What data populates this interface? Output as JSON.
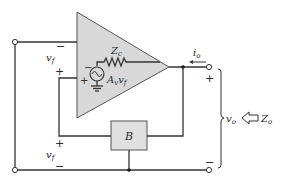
{
  "diagram": {
    "type": "feedback-amplifier-circuit",
    "amplifier": {
      "impedance_label": "Z",
      "impedance_sub": "c",
      "gain_label": "A",
      "gain_sub": "v",
      "gain_var": "v",
      "gain_var_sub": "f",
      "source_minus": "−",
      "source_plus": "+"
    },
    "feedback_block": {
      "label": "B"
    },
    "input_top": {
      "var": "v",
      "sub": "f",
      "top_sign": "−",
      "bottom_sign": "+"
    },
    "input_bottom": {
      "var": "v",
      "sub": "f",
      "top_sign": "+",
      "bottom_sign": "−"
    },
    "output_current": {
      "var": "i",
      "sub": "o"
    },
    "output_voltage": {
      "var": "v",
      "sub": "o",
      "plus": "+",
      "minus": "−"
    },
    "output_impedance": {
      "var": "Z",
      "sub": "o"
    },
    "colors": {
      "amplifier_fill": "#d8d8d8",
      "block_fill": "#e0e0e0",
      "wire": "#333333"
    }
  }
}
